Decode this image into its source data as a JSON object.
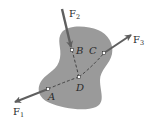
{
  "diagram": {
    "type": "rigid-body-force-diagram",
    "colors": {
      "body": "#9a9a9a",
      "force_arrow": "#5f5f5f",
      "dashed_line": "#3a3a3a",
      "point_fill": "#ffffff",
      "text": "#2a2a2a"
    },
    "points": [
      {
        "id": "A",
        "label": "A"
      },
      {
        "id": "B",
        "label": "B"
      },
      {
        "id": "C",
        "label": "C"
      },
      {
        "id": "D",
        "label": "D"
      }
    ],
    "forces": [
      {
        "id": "F1",
        "label": "F",
        "subscript": "1",
        "applied_at": "A",
        "direction": "lower-left"
      },
      {
        "id": "F2",
        "label": "F",
        "subscript": "2",
        "applied_at": "B",
        "direction": "downward"
      },
      {
        "id": "F3",
        "label": "F",
        "subscript": "3",
        "applied_at": "C",
        "direction": "upper-right"
      }
    ],
    "lines_of_action": [
      {
        "from": "B",
        "to": "D",
        "style": "dashed"
      },
      {
        "from": "A",
        "to": "D",
        "style": "dashed"
      },
      {
        "from": "D",
        "to": "C",
        "style": "dashed"
      }
    ]
  }
}
